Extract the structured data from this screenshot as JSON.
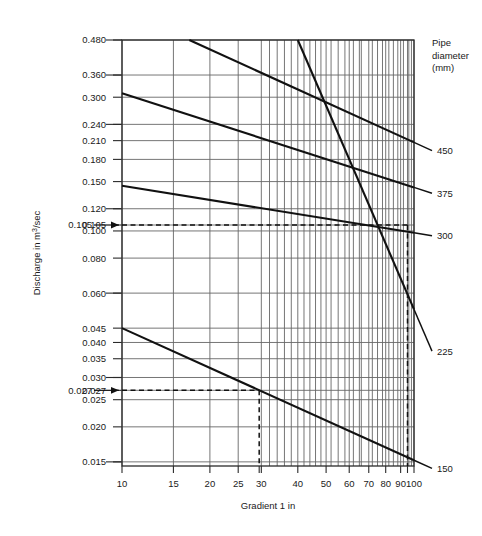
{
  "chart_data": {
    "type": "line",
    "title": "",
    "xlabel": "Gradient 1 in",
    "ylabel": "Discharge in m3/sec",
    "ylabel_display": "Discharge in m",
    "ylabel_sup": "3",
    "ylabel_tail": "/sec",
    "xscale": "log",
    "yscale": "log",
    "xlim": [
      10,
      100
    ],
    "ylim": [
      0.0145,
      0.48
    ],
    "grid": true,
    "legend_position": "right-outside",
    "legend_title_lines": [
      "Pipe",
      "diameter",
      "(mm)"
    ],
    "x_ticks": [
      10,
      15,
      20,
      25,
      30,
      40,
      50,
      60,
      70,
      80,
      90,
      100
    ],
    "x_tick_labels": [
      "10",
      "15",
      "20",
      "25",
      "30",
      "40",
      "50",
      "60",
      "70",
      "80",
      "90",
      "100"
    ],
    "y_ticks": [
      0.48,
      0.36,
      0.3,
      0.24,
      0.21,
      0.18,
      0.15,
      0.12,
      0.105,
      0.1,
      0.08,
      0.06,
      0.045,
      0.04,
      0.035,
      0.03,
      0.027,
      0.025,
      0.02,
      0.015
    ],
    "y_tick_labels": [
      "0.480",
      "0.360",
      "0.300",
      "0.240",
      "0.210",
      "0.180",
      "0.150",
      "0.120",
      "0.105",
      "0.100",
      "0.080",
      "0.060",
      "0.045",
      "0.040",
      "0.035",
      "0.030",
      "0.027",
      "0.025",
      "0.020",
      "0.015"
    ],
    "x_grid_values": [
      10,
      15,
      20,
      25,
      30,
      40,
      50,
      60,
      65,
      70,
      75,
      80,
      85,
      90,
      95,
      100
    ],
    "series": [
      {
        "name": "450",
        "label": "450",
        "points": [
          [
            17.0,
            0.48
          ],
          [
            100.0,
            0.207
          ]
        ]
      },
      {
        "name": "375",
        "label": "375",
        "points": [
          [
            10.0,
            0.31
          ],
          [
            100.0,
            0.143
          ]
        ]
      },
      {
        "name": "300",
        "label": "300",
        "points": [
          [
            10.0,
            0.145
          ],
          [
            100.0,
            0.0985
          ]
        ]
      },
      {
        "name": "225",
        "label": "225",
        "points": [
          [
            40.0,
            0.48
          ],
          [
            100.0,
            0.0525
          ]
        ]
      },
      {
        "name": "150",
        "label": "150",
        "points": [
          [
            10.0,
            0.045
          ],
          [
            100.0,
            0.0152
          ]
        ]
      }
    ],
    "annotations": [
      {
        "name": "discharge-0-105",
        "value": "0.105",
        "y": 0.105,
        "x_intersect": 95.0,
        "note": "dashed construction line to 300 mm pipe"
      },
      {
        "name": "discharge-0-027",
        "value": "0.027",
        "y": 0.027,
        "x_intersect": 29.5,
        "note": "dashed construction line to 150 mm pipe"
      }
    ]
  }
}
